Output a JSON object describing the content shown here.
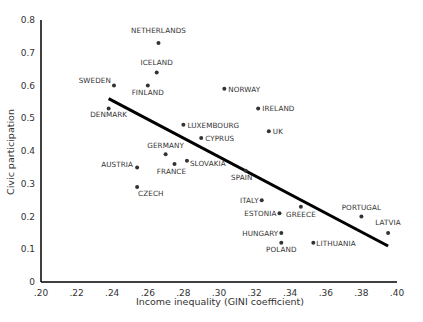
{
  "chart_data": {
    "type": "scatter",
    "title": "",
    "xlabel": "Income inequality (GINI coefficient)",
    "ylabel": "Civic participation",
    "xlim": [
      0.2,
      0.4
    ],
    "ylim": [
      0,
      0.8
    ],
    "x_ticks": [
      ".20",
      ".22",
      ".24",
      ".26",
      ".28",
      ".30",
      ".32",
      ".34",
      ".36",
      ".38",
      ".40"
    ],
    "y_ticks": [
      "0",
      "0.1",
      "0.2",
      "0.3",
      "0.4",
      "0.5",
      "0.6",
      "0.7",
      "0.8"
    ],
    "grid": false,
    "legend": null,
    "points": [
      {
        "label": "NETHERLANDS",
        "x": 0.266,
        "y": 0.73
      },
      {
        "label": "ICELAND",
        "x": 0.265,
        "y": 0.64
      },
      {
        "label": "FINLAND",
        "x": 0.26,
        "y": 0.6
      },
      {
        "label": "SWEDEN",
        "x": 0.241,
        "y": 0.6
      },
      {
        "label": "NORWAY",
        "x": 0.303,
        "y": 0.59
      },
      {
        "label": "DENMARK",
        "x": 0.238,
        "y": 0.53
      },
      {
        "label": "IRELAND",
        "x": 0.322,
        "y": 0.53
      },
      {
        "label": "LUXEMBOURG",
        "x": 0.28,
        "y": 0.48
      },
      {
        "label": "UK",
        "x": 0.328,
        "y": 0.46
      },
      {
        "label": "CYPRUS",
        "x": 0.29,
        "y": 0.44
      },
      {
        "label": "GERMANY",
        "x": 0.27,
        "y": 0.39
      },
      {
        "label": "SLOVAKIA",
        "x": 0.282,
        "y": 0.37
      },
      {
        "label": "FRANCE",
        "x": 0.275,
        "y": 0.36
      },
      {
        "label": "AUSTRIA",
        "x": 0.254,
        "y": 0.35
      },
      {
        "label": "SPAIN",
        "x": 0.315,
        "y": 0.34
      },
      {
        "label": "CZECH",
        "x": 0.254,
        "y": 0.29
      },
      {
        "label": "ITALY",
        "x": 0.324,
        "y": 0.25
      },
      {
        "label": "GREECE",
        "x": 0.346,
        "y": 0.23
      },
      {
        "label": "ESTONIA",
        "x": 0.334,
        "y": 0.21
      },
      {
        "label": "PORTUGAL",
        "x": 0.38,
        "y": 0.2
      },
      {
        "label": "HUNGARY",
        "x": 0.335,
        "y": 0.15
      },
      {
        "label": "LATVIA",
        "x": 0.395,
        "y": 0.15
      },
      {
        "label": "POLAND",
        "x": 0.335,
        "y": 0.12
      },
      {
        "label": "LITHUANIA",
        "x": 0.353,
        "y": 0.12
      }
    ],
    "trend_line": {
      "x": [
        0.238,
        0.395
      ],
      "y": [
        0.56,
        0.11
      ]
    },
    "colors": {
      "points": "#333333",
      "line": "#000000",
      "axis": "#000000",
      "text": "#333333"
    }
  },
  "label_layout": {
    "NETHERLANDS": {
      "dx": 0,
      "dy": -10,
      "anchor": "middle"
    },
    "ICELAND": {
      "dx": 0,
      "dy": -7,
      "anchor": "middle"
    },
    "FINLAND": {
      "dx": 0,
      "dy": 9,
      "anchor": "middle"
    },
    "SWEDEN": {
      "dx": -3,
      "dy": -3,
      "anchor": "end"
    },
    "NORWAY": {
      "dx": 4,
      "dy": 3,
      "anchor": "start"
    },
    "DENMARK": {
      "dx": 0,
      "dy": 9,
      "anchor": "middle"
    },
    "IRELAND": {
      "dx": 4,
      "dy": 3,
      "anchor": "start"
    },
    "LUXEMBOURG": {
      "dx": 4,
      "dy": 3,
      "anchor": "start"
    },
    "UK": {
      "dx": 4,
      "dy": 3,
      "anchor": "start"
    },
    "CYPRUS": {
      "dx": 4,
      "dy": 3,
      "anchor": "start"
    },
    "GERMANY": {
      "dx": 0,
      "dy": -6,
      "anchor": "middle"
    },
    "SLOVAKIA": {
      "dx": 3,
      "dy": 5,
      "anchor": "start"
    },
    "FRANCE": {
      "dx": -3,
      "dy": 10,
      "anchor": "middle"
    },
    "AUSTRIA": {
      "dx": -4,
      "dy": 0,
      "anchor": "end"
    },
    "SPAIN": {
      "dx": -4,
      "dy": 9,
      "anchor": "middle"
    },
    "CZECH": {
      "dx": 1,
      "dy": 9,
      "anchor": "start"
    },
    "ITALY": {
      "dx": -3,
      "dy": 3,
      "anchor": "end"
    },
    "GREECE": {
      "dx": 0,
      "dy": 10,
      "anchor": "middle"
    },
    "ESTONIA": {
      "dx": -3,
      "dy": 3,
      "anchor": "end"
    },
    "PORTUGAL": {
      "dx": 0,
      "dy": -7,
      "anchor": "middle"
    },
    "HUNGARY": {
      "dx": -3,
      "dy": 3,
      "anchor": "end"
    },
    "LATVIA": {
      "dx": 0,
      "dy": -8,
      "anchor": "middle"
    },
    "POLAND": {
      "dx": 0,
      "dy": 9,
      "anchor": "middle"
    },
    "LITHUANIA": {
      "dx": 3,
      "dy": 3,
      "anchor": "start"
    }
  }
}
